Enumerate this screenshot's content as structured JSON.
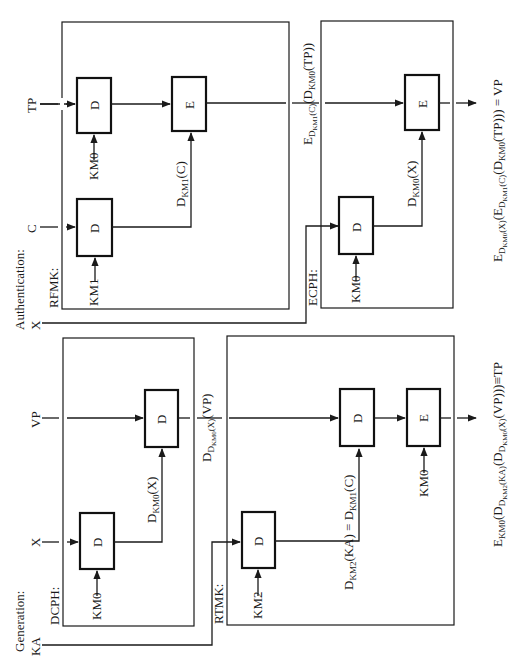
{
  "diagram": {
    "orientation": "rotated-90-ccw",
    "authentication": {
      "section_label": "Authentication:",
      "input_x": "X",
      "rfmk": {
        "label": "RFMK:",
        "input_tp": "TP",
        "input_c": "C",
        "block_d1": "D",
        "block_d2": "D",
        "block_e": "E",
        "key_km0": "KM0",
        "key_km1": "KM1",
        "label_dkm1c": "D",
        "label_dkm1c_sub": "KM1",
        "label_dkm1c_arg": "(C)"
      },
      "mid_output": {
        "main": "E",
        "sub": "D",
        "subsub": "KM1",
        "sub_arg": "(C)",
        "inner": "(D",
        "inner_sub": "KM0",
        "inner_arg": "(TP))"
      },
      "ecph": {
        "label": "ECPH:",
        "block_d": "D",
        "block_e": "E",
        "key_km0": "KM0",
        "label_dkm0x": "D",
        "label_dkm0x_sub": "KM0",
        "label_dkm0x_arg": "(X)"
      },
      "final_output_text": "E_{D_{KM0}(X)}(E_{D_{KM1}(C)}(D_{KM0}(TP))) = VP",
      "final_output": {
        "p1": "E",
        "p1_sub": "D",
        "p1_subsub": "KM0",
        "p1_subarg": "(X)",
        "p2": "(E",
        "p2_sub": "D",
        "p2_subsub": "KM1",
        "p2_subarg": "(C)",
        "p3": "(D",
        "p3_sub": "KM0",
        "p3_arg": "(TP))) = VP"
      }
    },
    "generation": {
      "section_label": "Generation:",
      "input_ka": "KA",
      "dcph": {
        "label": "DCPH:",
        "input_x": "X",
        "input_vp": "VP",
        "block_d1": "D",
        "block_d2": "D",
        "key_km0": "KM0",
        "label_dkm0x": "D",
        "label_dkm0x_sub": "KM0",
        "label_dkm0x_arg": "(X)"
      },
      "mid_output": {
        "main": "D",
        "sub": "D",
        "subsub": "KM0",
        "sub_arg": "(X)",
        "arg": "(VP)"
      },
      "rtmk": {
        "label": "RTMK:",
        "block_d1": "D",
        "block_d2": "D",
        "block_e": "E",
        "key_km2": "KM2",
        "key_km0": "KM0",
        "label_eq_p1": "D",
        "label_eq_p1_sub": "KM2",
        "label_eq_p1_arg": "(KA) = D",
        "label_eq_p2_sub": "KM1",
        "label_eq_p2_arg": "(C)"
      },
      "final_output_text": "E_{KM0}(D_{D_{KM2}(KA)}(D_{D_{KM0}(X)}(VP)))≡TP",
      "final_output": {
        "p1": "E",
        "p1_sub": "KM0",
        "p2": "(D",
        "p2_sub": "D",
        "p2_subsub": "KM2",
        "p2_subarg": "(KA)",
        "p3": "(D",
        "p3_sub": "D",
        "p3_subsub": "KM0",
        "p3_subarg": "(X)",
        "p3_arg": "(VP)))≡TP"
      }
    }
  }
}
